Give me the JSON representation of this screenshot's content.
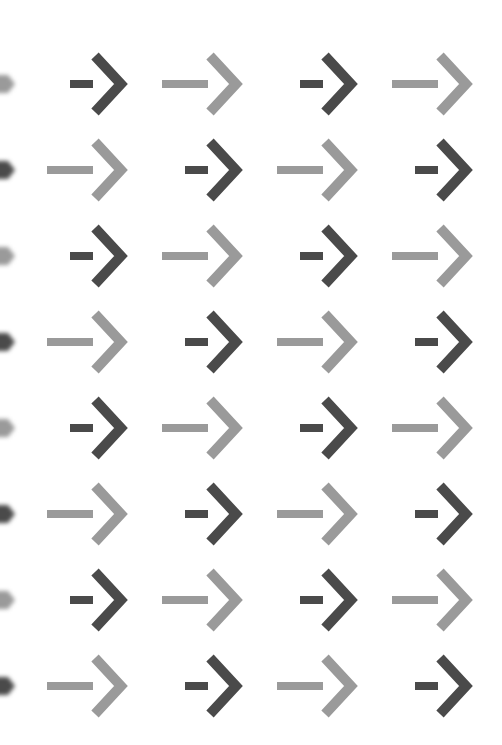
{
  "pattern": {
    "background": "#ffffff",
    "colors": {
      "dark": "#4a4a4a",
      "light": "#9a9a9a"
    },
    "row_centers_y": [
      84,
      170,
      256,
      342,
      428,
      514,
      600,
      686
    ],
    "column_tips_x": [
      125,
      240,
      355,
      470
    ],
    "rows": [
      [
        "dark",
        "light",
        "dark",
        "light"
      ],
      [
        "light",
        "dark",
        "light",
        "dark"
      ],
      [
        "dark",
        "light",
        "dark",
        "light"
      ],
      [
        "light",
        "dark",
        "light",
        "dark"
      ],
      [
        "dark",
        "light",
        "dark",
        "light"
      ],
      [
        "light",
        "dark",
        "light",
        "dark"
      ],
      [
        "dark",
        "light",
        "dark",
        "light"
      ],
      [
        "light",
        "dark",
        "light",
        "dark"
      ]
    ],
    "edge_tips": [
      "light",
      "dark",
      "light",
      "dark",
      "light",
      "dark",
      "light",
      "dark"
    ],
    "icon": "right-arrow-icon"
  }
}
